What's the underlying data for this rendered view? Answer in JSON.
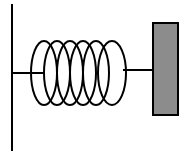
{
  "diagram": {
    "components": [
      "wall",
      "spring",
      "mass-block"
    ],
    "spring": {
      "coils": 6
    },
    "colors": {
      "line": "#000000",
      "block_fill": "#8c8c8c",
      "background": "#ffffff"
    }
  }
}
